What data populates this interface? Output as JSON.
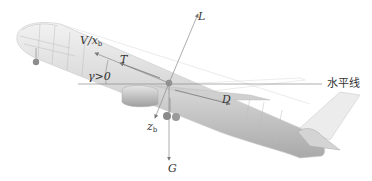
{
  "diagram": {
    "title": "",
    "labels": {
      "lift": "L",
      "velocity": "V/x",
      "velocity_sub": "b",
      "thrust": "T",
      "flight_path_angle": "γ>0",
      "drag": "D",
      "horizontal_line": "水平线",
      "body_z_axis": "z",
      "body_z_axis_sub": "b",
      "gravity": "G"
    },
    "colors": {
      "line": "#8a8a8a",
      "text": "#333333",
      "fuselage": "#d4d4d4",
      "fuselage_shadow": "#b8b8b8"
    },
    "vectors": [
      {
        "name": "L",
        "direction": "up, slightly tilted right (perpendicular to velocity)"
      },
      {
        "name": "V/xb",
        "direction": "forward along body axis, up-left"
      },
      {
        "name": "T",
        "direction": "along body axis, up-left"
      },
      {
        "name": "D",
        "direction": "backward along flight path, down-right"
      },
      {
        "name": "G",
        "direction": "straight down"
      },
      {
        "name": "zb",
        "direction": "body z-axis, down-left"
      }
    ]
  }
}
